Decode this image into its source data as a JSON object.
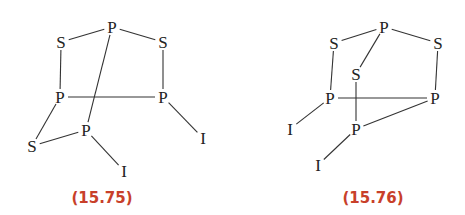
{
  "structures": [
    {
      "id": "15.75",
      "label": "(15.75)",
      "atoms": [
        {
          "el": "P",
          "x": 112,
          "y": 27
        },
        {
          "el": "S",
          "x": 61,
          "y": 42
        },
        {
          "el": "S",
          "x": 163,
          "y": 42
        },
        {
          "el": "P",
          "x": 60,
          "y": 97
        },
        {
          "el": "P",
          "x": 163,
          "y": 97
        },
        {
          "el": "P",
          "x": 86,
          "y": 130
        },
        {
          "el": "S",
          "x": 32,
          "y": 146
        },
        {
          "el": "I",
          "x": 203,
          "y": 138
        },
        {
          "el": "I",
          "x": 124,
          "y": 171
        }
      ],
      "bonds": [
        [
          0,
          1
        ],
        [
          0,
          2
        ],
        [
          1,
          3
        ],
        [
          2,
          4
        ],
        [
          3,
          4
        ],
        [
          0,
          5
        ],
        [
          3,
          6
        ],
        [
          5,
          6
        ],
        [
          4,
          7
        ],
        [
          5,
          8
        ]
      ],
      "label_pos": {
        "x": 102,
        "y": 203
      }
    },
    {
      "id": "15.76",
      "label": "(15.76)",
      "atoms": [
        {
          "el": "P",
          "x": 384,
          "y": 27
        },
        {
          "el": "S",
          "x": 334,
          "y": 43
        },
        {
          "el": "S",
          "x": 438,
          "y": 43
        },
        {
          "el": "S",
          "x": 356,
          "y": 74
        },
        {
          "el": "P",
          "x": 330,
          "y": 98
        },
        {
          "el": "P",
          "x": 435,
          "y": 98
        },
        {
          "el": "P",
          "x": 356,
          "y": 129
        },
        {
          "el": "I",
          "x": 290,
          "y": 129
        },
        {
          "el": "I",
          "x": 318,
          "y": 165
        }
      ],
      "bonds": [
        [
          0,
          1
        ],
        [
          0,
          2
        ],
        [
          0,
          3
        ],
        [
          1,
          4
        ],
        [
          2,
          5
        ],
        [
          4,
          5
        ],
        [
          3,
          6
        ],
        [
          5,
          6
        ],
        [
          4,
          7
        ],
        [
          6,
          8
        ]
      ],
      "label_pos": {
        "x": 373,
        "y": 203
      }
    }
  ],
  "colors": {
    "label": "#c8402a",
    "atom": "#222222",
    "bond": "#333333"
  }
}
